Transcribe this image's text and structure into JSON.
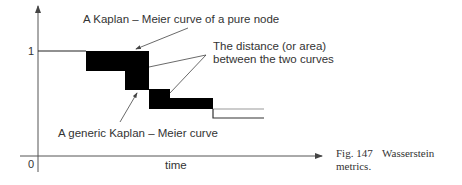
{
  "figure": {
    "caption_label": "Fig. 147",
    "caption_title": "Wasserstein",
    "caption_line2": "metrics."
  },
  "axes": {
    "x_label": "time",
    "y_tick_top": "1",
    "origin_label": "0"
  },
  "annotations": {
    "pure_node_curve": "A Kaplan – Meier curve of a pure node",
    "distance_line1": "The distance (or area)",
    "distance_line2": "between the two curves",
    "generic_curve": "A generic Kaplan – Meier curve"
  },
  "colors": {
    "axis": "#555555",
    "fill": "#000000",
    "pure_curve_tail": "#9a9a9a",
    "generic_curve_tail": "#333333",
    "text": "#333333"
  }
}
